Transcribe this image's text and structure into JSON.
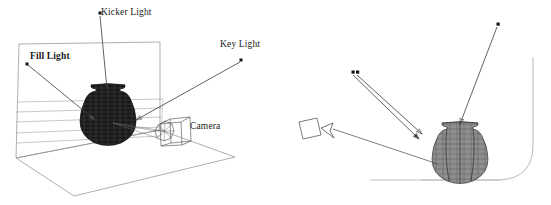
{
  "figure": {
    "background_color": "#ffffff",
    "line_color": "#3a3a3a",
    "grid_color": "#9a9a9a",
    "vase_left_color": "#151515",
    "vase_right_color": "#6e6e6e"
  },
  "left_panel": {
    "name": "perspective-lighting-setup",
    "labels": {
      "kicker_light": "Kicker Light",
      "fill_light": "Fill Light",
      "key_light": "Key Light",
      "camera": "Camera"
    },
    "markers": {
      "kicker_light_point": "kicker-light-source-marker",
      "fill_light_point": "fill-light-source-marker",
      "key_light_point": "key-light-source-marker"
    },
    "objects": {
      "vase": "wireframe-vase",
      "camera_widget": "wireframe-camera",
      "back_wall": "backdrop-wall",
      "ground_plane": "ground-plane"
    }
  },
  "right_panel": {
    "name": "side-view-lighting-setup",
    "objects": {
      "vase": "wireframe-vase",
      "camera_box": "camera-box",
      "backdrop": "curved-cyclorama-backdrop",
      "floor_line": "floor-line"
    },
    "markers": {
      "double_light_point": "double-light-source-marker",
      "key_light_point": "key-light-source-marker"
    }
  }
}
